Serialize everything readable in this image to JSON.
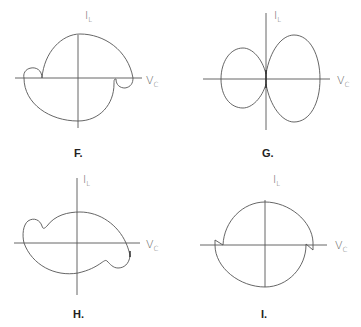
{
  "figure": {
    "panels": [
      {
        "id": "F",
        "label": "F.",
        "y_axis_label": "I",
        "y_axis_sub": "L",
        "x_axis_label": "V",
        "x_axis_sub": "C",
        "description": "Circular I-V trajectory split at the V axis, with small reverse loops at both ends"
      },
      {
        "id": "G",
        "label": "G.",
        "y_axis_label": "I",
        "y_axis_sub": "L",
        "x_axis_label": "V",
        "x_axis_sub": "C",
        "description": "Two-lobed figure-eight shape touching at the origin; right lobe larger"
      },
      {
        "id": "H",
        "label": "H.",
        "y_axis_label": "I",
        "y_axis_sub": "L",
        "x_axis_label": "V",
        "x_axis_sub": "C",
        "description": "Tilted elliptical trajectory with dimple bulges near both ends"
      },
      {
        "id": "I",
        "label": "I.",
        "y_axis_label": "I",
        "y_axis_sub": "L",
        "x_axis_label": "V",
        "x_axis_sub": "C",
        "description": "Circle with small step discontinuities where it crosses the V axis"
      }
    ]
  }
}
